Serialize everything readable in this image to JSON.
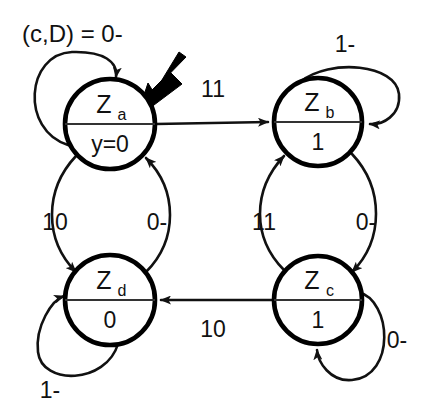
{
  "diagram": {
    "legend": {
      "text": "(c,D) = 0-"
    },
    "colors": {
      "stroke": "#000000",
      "background": "#ffffff",
      "label": "#111111"
    },
    "states": [
      {
        "id": "Za",
        "name": "Z",
        "subscript": "a",
        "output": "y=0",
        "cx": 110,
        "cy": 124,
        "r": 45,
        "initial": true
      },
      {
        "id": "Zb",
        "name": "Z",
        "subscript": "b",
        "output": "1",
        "cx": 318,
        "cy": 122,
        "r": 44,
        "initial": false
      },
      {
        "id": "Zc",
        "name": "Z",
        "subscript": "c",
        "output": "1",
        "cx": 318,
        "cy": 300,
        "r": 44,
        "initial": false
      },
      {
        "id": "Zd",
        "name": "Z",
        "subscript": "d",
        "output": "0",
        "cx": 110,
        "cy": 300,
        "r": 45,
        "initial": false
      }
    ],
    "transitions": [
      {
        "id": "za-zb",
        "from": "Za",
        "to": "Zb",
        "label": "11",
        "label_x": 213,
        "label_y": 97
      },
      {
        "id": "zc-zd",
        "from": "Zc",
        "to": "Zd",
        "label": "10",
        "label_x": 213,
        "label_y": 330
      },
      {
        "id": "za-zd",
        "from": "Za",
        "to": "Zd",
        "label": "10",
        "label_x": 55,
        "label_y": 222
      },
      {
        "id": "zd-za",
        "from": "Zd",
        "to": "Za",
        "label": "0-",
        "label_x": 157,
        "label_y": 222
      },
      {
        "id": "zc-zb",
        "from": "Zc",
        "to": "Zb",
        "label": "11",
        "label_x": 264,
        "label_y": 222
      },
      {
        "id": "zb-zc",
        "from": "Zb",
        "to": "Zc",
        "label": "0-",
        "label_x": 366,
        "label_y": 222
      }
    ],
    "self_loops": [
      {
        "id": "za-self",
        "state": "Za",
        "label": "(c,D) = 0-",
        "label_x": 22,
        "label_y": 42
      },
      {
        "id": "zb-self",
        "state": "Zb",
        "label": "1-",
        "label_x": 345,
        "label_y": 52
      },
      {
        "id": "zc-self",
        "state": "Zc",
        "label": "0-",
        "label_x": 397,
        "label_y": 348
      },
      {
        "id": "zd-self",
        "state": "Zd",
        "label": "1-",
        "label_x": 50,
        "label_y": 398
      }
    ]
  }
}
